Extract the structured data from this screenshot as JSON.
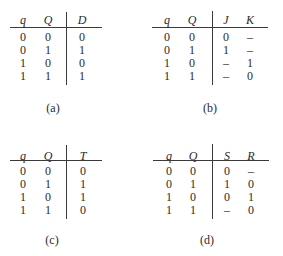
{
  "tables": [
    {
      "caption": "(a)",
      "headers": [
        "q",
        "Q",
        "D"
      ],
      "rows": [
        [
          "0",
          "0",
          "0"
        ],
        [
          "0",
          "1",
          "1"
        ],
        [
          "1",
          "0",
          "0"
        ],
        [
          "1",
          "1",
          "1"
        ]
      ]
    },
    {
      "caption": "(b)",
      "headers": [
        "q",
        "Q",
        "J",
        "K"
      ],
      "rows": [
        [
          "0",
          "0",
          "0",
          "–"
        ],
        [
          "0",
          "1",
          "1",
          "–"
        ],
        [
          "1",
          "0",
          "–",
          "1"
        ],
        [
          "1",
          "1",
          "–",
          "0"
        ]
      ]
    },
    {
      "caption": "(c)",
      "headers": [
        "q",
        "Q",
        "T"
      ],
      "rows": [
        [
          "0",
          "0",
          "0"
        ],
        [
          "0",
          "1",
          "1"
        ],
        [
          "1",
          "0",
          "1"
        ],
        [
          "1",
          "1",
          "0"
        ]
      ]
    },
    {
      "caption": "(d)",
      "headers": [
        "q",
        "Q",
        "S",
        "R"
      ],
      "rows": [
        [
          "0",
          "0",
          "0",
          "–"
        ],
        [
          "0",
          "1",
          "1",
          "0"
        ],
        [
          "1",
          "0",
          "0",
          "1"
        ],
        [
          "1",
          "1",
          "–",
          "0"
        ]
      ]
    }
  ]
}
